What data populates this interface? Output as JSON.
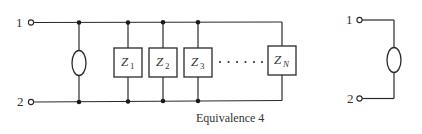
{
  "diagram": {
    "caption": "Equivalence 4",
    "left_circuit": {
      "terminal_top_label": "1",
      "terminal_bottom_label": "2",
      "source_element": "current-source-oval",
      "impedances": [
        {
          "main": "Z",
          "sub": "1"
        },
        {
          "main": "Z",
          "sub": "2"
        },
        {
          "main": "Z",
          "sub": "3"
        },
        {
          "main": "Z",
          "sub": "N"
        }
      ],
      "ellipsis": "· · · · · ·"
    },
    "right_circuit": {
      "terminal_top_label": "1",
      "terminal_bottom_label": "2",
      "source_element": "current-source-oval"
    },
    "colors": {
      "line": "#2a2a2a",
      "text": "#333333",
      "background": "#ffffff"
    }
  }
}
